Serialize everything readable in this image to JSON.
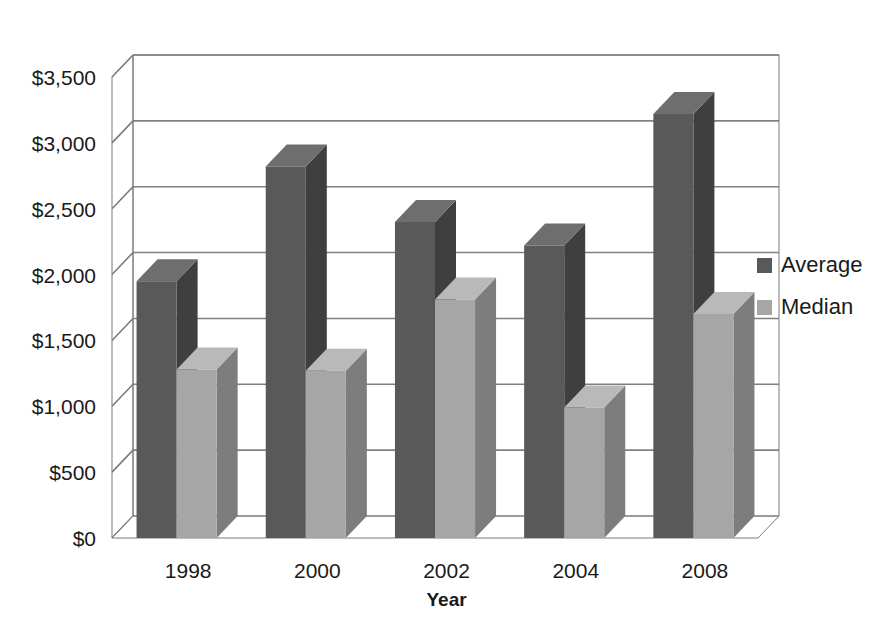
{
  "chart_data": {
    "type": "bar",
    "title": "",
    "subtitle": "",
    "xlabel": "Year",
    "ylabel": "",
    "categories": [
      "1998",
      "2000",
      "2002",
      "2004",
      "2008"
    ],
    "series": [
      {
        "name": "Average",
        "values": [
          1950,
          2820,
          2400,
          2220,
          3220
        ],
        "color": "#595959"
      },
      {
        "name": "Median",
        "values": [
          1280,
          1270,
          1810,
          990,
          1700
        ],
        "color": "#a6a6a6"
      }
    ],
    "ylim": [
      0,
      3500
    ],
    "ytick_values": [
      0,
      500,
      1000,
      1500,
      2000,
      2500,
      3000,
      3500
    ],
    "ytick_labels": [
      "$0",
      "$500",
      "$1,000",
      "$1,500",
      "$2,000",
      "$2,500",
      "$3,000",
      "$3,500"
    ],
    "grid": true,
    "grid_axis": "y",
    "legend_position": "right",
    "style": "3d-column",
    "currency_prefix": "$"
  },
  "axis": {
    "x_title": "Year",
    "y_ticks": [
      {
        "label": "$3,500",
        "value": 3500
      },
      {
        "label": "$3,000",
        "value": 3000
      },
      {
        "label": "$2,500",
        "value": 2500
      },
      {
        "label": "$2,000",
        "value": 2000
      },
      {
        "label": "$1,500",
        "value": 1500
      },
      {
        "label": "$1,000",
        "value": 1000
      },
      {
        "label": "$500",
        "value": 500
      },
      {
        "label": "$0",
        "value": 0
      }
    ],
    "x_ticks": [
      {
        "label": "1998"
      },
      {
        "label": "2000"
      },
      {
        "label": "2002"
      },
      {
        "label": "2004"
      },
      {
        "label": "2008"
      }
    ]
  },
  "legend": {
    "entries": [
      {
        "label": "Average",
        "color": "#595959",
        "swatch_name": "legend-swatch-average"
      },
      {
        "label": "Median",
        "color": "#a6a6a6",
        "swatch_name": "legend-swatch-median"
      }
    ]
  },
  "colors": {
    "average_front": "#595959",
    "average_side": "#3f3f3f",
    "average_top": "#6e6e6e",
    "median_front": "#a6a6a6",
    "median_side": "#7d7d7d",
    "median_top": "#b9b9b9",
    "gridline": "#808080",
    "axis_line": "#7a7a7a",
    "background": "#ffffff",
    "text": "#1a1a1a"
  }
}
